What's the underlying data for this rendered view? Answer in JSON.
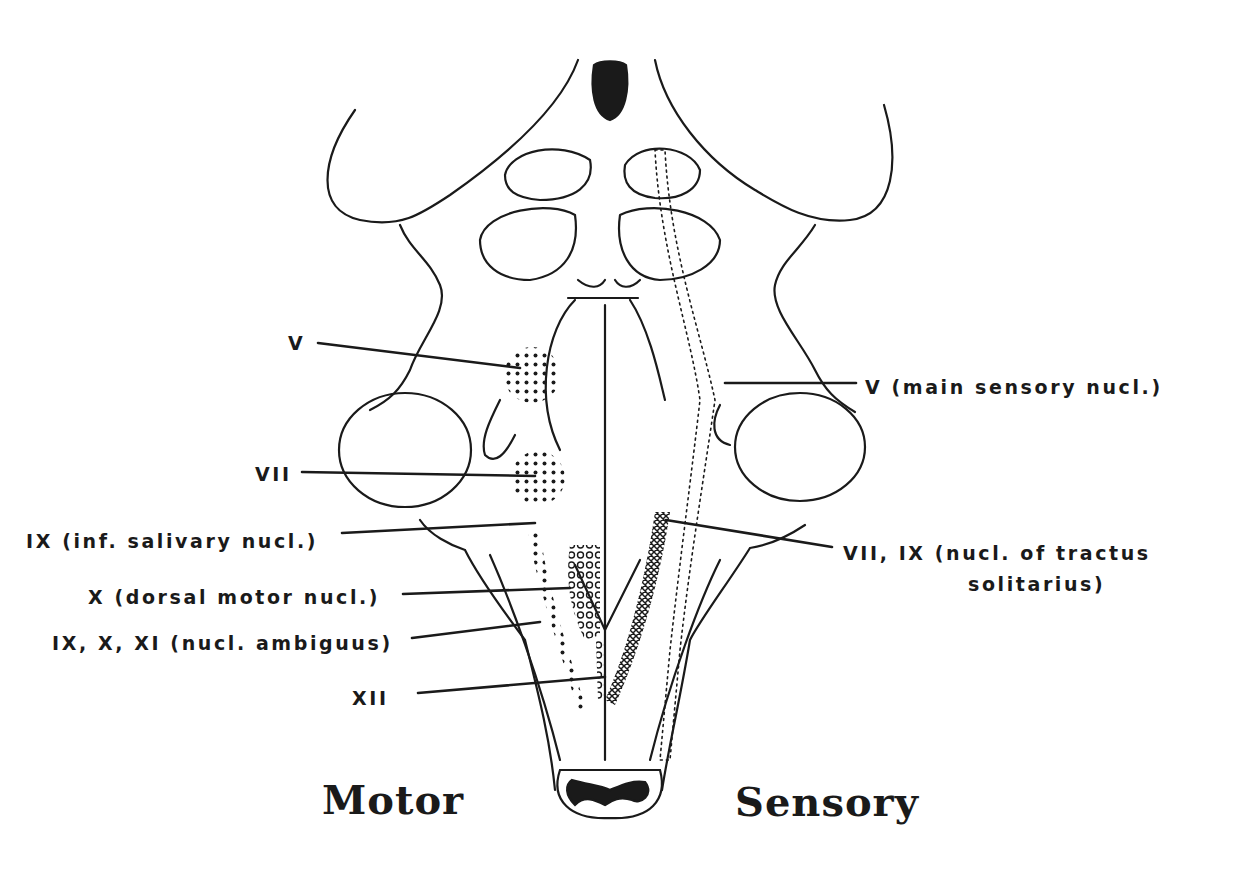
{
  "diagram": {
    "colors": {
      "ink": "#1a1a1a",
      "background": "#ffffff"
    },
    "motor_labels": [
      {
        "id": "v",
        "text": "V"
      },
      {
        "id": "vii",
        "text": "VII"
      },
      {
        "id": "ix",
        "text": "IX (inf. salivary nucl.)"
      },
      {
        "id": "x",
        "text": "X (dorsal motor nucl.)"
      },
      {
        "id": "amb",
        "text": "IX, X, XI (nucl. ambiguus)"
      },
      {
        "id": "xii",
        "text": "XII"
      }
    ],
    "sensory_labels": [
      {
        "id": "v_main",
        "text": "V (main sensory nucl.)"
      },
      {
        "id": "sol_1",
        "text": "VII, IX (nucl. of tractus"
      },
      {
        "id": "sol_2",
        "text": "solitarius)"
      }
    ],
    "side_titles": {
      "left": "Motor",
      "right": "Sensory"
    }
  }
}
